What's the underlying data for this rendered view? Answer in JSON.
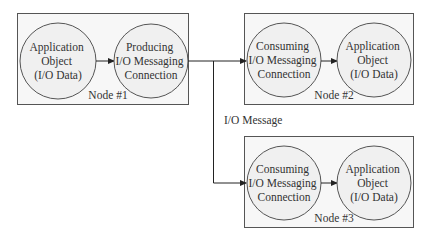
{
  "diagram": {
    "nodes": [
      {
        "label": "Node #1",
        "circles": [
          {
            "lines": [
              "Application",
              "Object",
              "(I/O Data)"
            ]
          },
          {
            "lines": [
              "Producing",
              "I/O Messaging",
              "Connection"
            ]
          }
        ]
      },
      {
        "label": "Node #2",
        "circles": [
          {
            "lines": [
              "Consuming",
              "I/O Messaging",
              "Connection"
            ]
          },
          {
            "lines": [
              "Application",
              "Object",
              "(I/O Data)"
            ]
          }
        ]
      },
      {
        "label": "Node #3",
        "circles": [
          {
            "lines": [
              "Consuming",
              "I/O Messaging",
              "Connection"
            ]
          },
          {
            "lines": [
              "Application",
              "Object",
              "(I/O Data)"
            ]
          }
        ]
      }
    ],
    "message_label": "I/O Message"
  }
}
